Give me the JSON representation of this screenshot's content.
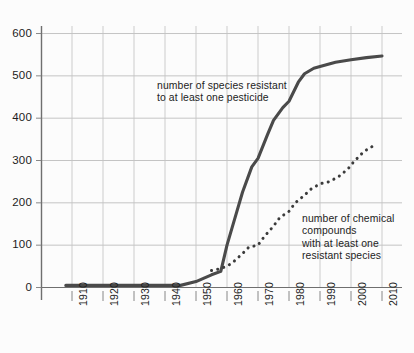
{
  "chart_data": {
    "type": "line",
    "title": "",
    "subtitle": "",
    "xlabel": "",
    "ylabel": "",
    "xlim": [
      1905,
      2015
    ],
    "ylim": [
      0,
      620
    ],
    "grid": true,
    "legend_position": "inline-annotations",
    "y_ticks": [
      0,
      100,
      200,
      300,
      400,
      500,
      600
    ],
    "y_tick_labels": [
      "0",
      "100",
      "200",
      "300",
      "400",
      "500",
      "600"
    ],
    "x_ticks": [
      1910,
      1920,
      1930,
      1940,
      1950,
      1960,
      1970,
      1980,
      1990,
      2000,
      2010
    ],
    "x_tick_labels": [
      "1910",
      "1920",
      "1930",
      "1940",
      "1950",
      "1960",
      "1970",
      "1980",
      "1990",
      "2000",
      "2010"
    ],
    "series": [
      {
        "name": "number of species resistant to at least one pesticide",
        "style": "solid",
        "color": "#4a4a4a",
        "x": [
          1908,
          1920,
          1930,
          1940,
          1945,
          1950,
          1955,
          1958,
          1960,
          1963,
          1965,
          1968,
          1970,
          1973,
          1975,
          1978,
          1980,
          1983,
          1985,
          1988,
          1990,
          1995,
          2000,
          2005,
          2010
        ],
        "values": [
          5,
          5,
          5,
          5,
          5,
          14,
          30,
          38,
          100,
          175,
          225,
          285,
          305,
          360,
          395,
          425,
          440,
          485,
          505,
          518,
          522,
          532,
          538,
          543,
          547
        ]
      },
      {
        "name": "number of chemical compounds with at least one resistant species",
        "style": "dotted",
        "color": "#3b3b3b",
        "x": [
          1955,
          1957,
          1960,
          1962,
          1965,
          1967,
          1970,
          1972,
          1975,
          1977,
          1980,
          1982,
          1985,
          1987,
          1990,
          1993,
          1996,
          1999,
          2001,
          2004,
          2006,
          2008
        ],
        "values": [
          40,
          43,
          50,
          60,
          80,
          95,
          100,
          120,
          145,
          165,
          180,
          200,
          218,
          232,
          245,
          250,
          262,
          280,
          298,
          320,
          330,
          337
        ]
      }
    ],
    "annotations": [
      {
        "id": "species",
        "text": "number of species resistant\nto at least one pesticide",
        "x": 1925,
        "y": 460
      },
      {
        "id": "compounds",
        "text": "number of chemical\ncompounds\nwith at least one\nresistant species",
        "x": 1990,
        "y": 195
      }
    ]
  }
}
